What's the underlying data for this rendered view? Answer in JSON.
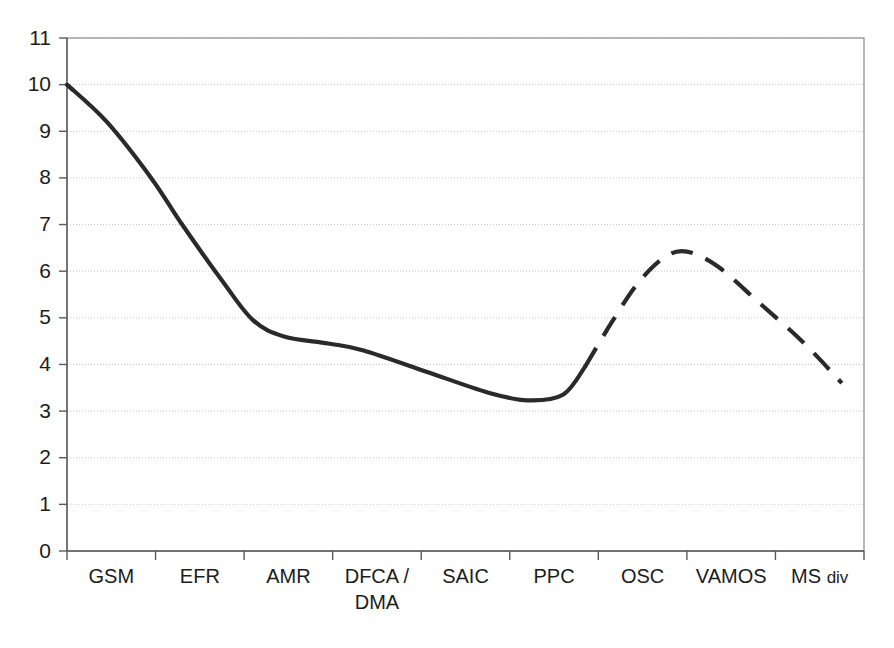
{
  "chart_data": {
    "type": "line",
    "title": "",
    "subtitle": "",
    "xlabel": "",
    "ylabel": "",
    "categories": [
      "GSM",
      "EFR",
      "AMR",
      "DFCA / DMA",
      "SAIC",
      "PPC",
      "OSC",
      "VAMOS",
      "MS div"
    ],
    "x_tick_labels": [
      "GSM",
      "EFR",
      "AMR",
      "DFCA /",
      "SAIC",
      "PPC",
      "OSC",
      "VAMOS",
      "MS"
    ],
    "x_tick_labels_line2": [
      "",
      "",
      "",
      "DMA",
      "",
      "",
      "",
      "",
      ""
    ],
    "x_tick_label_suffix": [
      "",
      "",
      "",
      "",
      "",
      "",
      "",
      "",
      "div"
    ],
    "y_tick_labels": [
      "0",
      "1",
      "2",
      "3",
      "4",
      "5",
      "6",
      "7",
      "8",
      "9",
      "10",
      "11"
    ],
    "y_ticks": [
      0,
      1,
      2,
      3,
      4,
      5,
      6,
      7,
      8,
      9,
      10,
      11
    ],
    "ylim": [
      0,
      11
    ],
    "xlim": [
      0,
      9
    ],
    "grid": true,
    "grid_axis": "y",
    "legend": false,
    "legend_position": "none",
    "series": [
      {
        "name": "capacity gain",
        "style": "solid",
        "values": [
          10.0,
          7.9,
          4.95,
          4.55,
          4.3,
          3.25,
          null,
          null,
          null
        ],
        "points": [
          {
            "x": 0.0,
            "y": 10.0
          },
          {
            "x": 0.45,
            "y": 9.2
          },
          {
            "x": 0.95,
            "y": 8.0
          },
          {
            "x": 1.3,
            "y": 7.0
          },
          {
            "x": 1.75,
            "y": 5.8
          },
          {
            "x": 2.1,
            "y": 4.95
          },
          {
            "x": 2.45,
            "y": 4.6
          },
          {
            "x": 2.95,
            "y": 4.45
          },
          {
            "x": 3.35,
            "y": 4.3
          },
          {
            "x": 4.05,
            "y": 3.85
          },
          {
            "x": 4.75,
            "y": 3.4
          },
          {
            "x": 5.2,
            "y": 3.23
          },
          {
            "x": 5.6,
            "y": 3.35
          },
          {
            "x": 5.85,
            "y": 3.95
          }
        ]
      },
      {
        "name": "projected capacity gain",
        "style": "dashed",
        "values": [
          null,
          null,
          null,
          null,
          null,
          3.95,
          6.42,
          5.4,
          3.6
        ],
        "points": [
          {
            "x": 5.85,
            "y": 3.95
          },
          {
            "x": 6.15,
            "y": 4.9
          },
          {
            "x": 6.45,
            "y": 5.75
          },
          {
            "x": 6.75,
            "y": 6.3
          },
          {
            "x": 7.0,
            "y": 6.42
          },
          {
            "x": 7.35,
            "y": 6.1
          },
          {
            "x": 7.8,
            "y": 5.35
          },
          {
            "x": 8.3,
            "y": 4.5
          },
          {
            "x": 8.75,
            "y": 3.6
          }
        ]
      }
    ],
    "colors": {
      "line": "#2a2a2a",
      "grid": "#c9c9c9",
      "axis": "#5a5a5a",
      "border": "#8a8a8a",
      "background": "#ffffff"
    }
  }
}
